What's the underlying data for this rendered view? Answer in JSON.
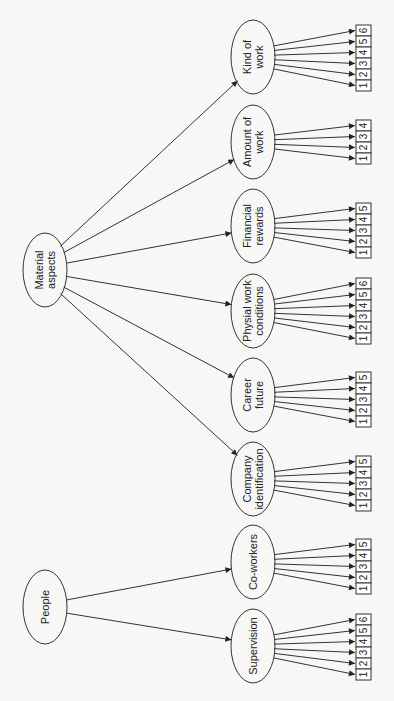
{
  "diagram": {
    "roots": [
      {
        "id": "material",
        "lines": [
          "Material",
          "aspects"
        ],
        "cx": 45,
        "cy": 270
      },
      {
        "id": "people",
        "lines": [
          "People"
        ],
        "cx": 45,
        "cy": 607
      }
    ],
    "children": [
      {
        "id": "kind",
        "parent": "material",
        "lines": [
          "Kind of",
          "work"
        ],
        "cy": 57,
        "items": 6,
        "box_top": 25
      },
      {
        "id": "amount",
        "parent": "material",
        "lines": [
          "Amount of",
          "work"
        ],
        "cy": 142,
        "items": 4,
        "box_top": 120
      },
      {
        "id": "financial",
        "parent": "material",
        "lines": [
          "Financial",
          "rewards"
        ],
        "cy": 226,
        "items": 5,
        "box_top": 203
      },
      {
        "id": "physical",
        "parent": "material",
        "lines": [
          "Physial work",
          "conditions"
        ],
        "cy": 311,
        "items": 6,
        "box_top": 278
      },
      {
        "id": "career",
        "parent": "material",
        "lines": [
          "Career",
          "future"
        ],
        "cy": 395,
        "items": 5,
        "box_top": 372
      },
      {
        "id": "company",
        "parent": "material",
        "lines": [
          "Company",
          "identification"
        ],
        "cy": 479,
        "items": 5,
        "box_top": 456
      },
      {
        "id": "coworkers",
        "parent": "people",
        "lines": [
          "Co-workers"
        ],
        "cy": 562,
        "items": 5,
        "box_top": 539
      },
      {
        "id": "supervision",
        "parent": "people",
        "lines": [
          "Supervision"
        ],
        "cy": 646,
        "items": 6,
        "box_top": 614
      }
    ],
    "colors": {
      "stroke": "#333333",
      "box_fill": "#ffffff",
      "background": "#f7f7f5"
    }
  }
}
